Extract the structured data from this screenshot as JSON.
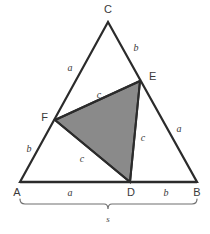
{
  "figure": {
    "background_color": "#ffffff",
    "stroke_color": "#2b2b2b",
    "shaded_fill_color": "#8a8a8a",
    "bracket_color": "#6e6e6e",
    "label_color": "#3a3a3a"
  },
  "vertices": [
    {
      "name": "C",
      "label": "C",
      "x": 108,
      "y": 22,
      "label_x": 108,
      "label_y": 11
    },
    {
      "name": "E",
      "label": "E",
      "x": 140,
      "y": 81,
      "label_x": 150,
      "label_y": 79
    },
    {
      "name": "F",
      "label": "F",
      "x": 55,
      "y": 120,
      "label_x": 44,
      "label_y": 119
    },
    {
      "name": "A",
      "label": "A",
      "x": 20,
      "y": 182,
      "label_x": 16,
      "label_y": 194
    },
    {
      "name": "D",
      "label": "D",
      "x": 130,
      "y": 182,
      "label_x": 130,
      "label_y": 194
    },
    {
      "name": "B",
      "label": "B",
      "x": 197,
      "y": 182,
      "label_x": 198,
      "label_y": 194
    }
  ],
  "outer_triangle": {
    "name": "triangle-ABC",
    "points": "20,182 108,22 197,182"
  },
  "shaded_triangle": {
    "name": "triangle-DEF",
    "points": "55,120 140,81 130,182",
    "fill": "#8a8a8a"
  },
  "segments": [
    {
      "name": "segment-AC",
      "x1": 20,
      "y1": 182,
      "x2": 108,
      "y2": 22
    },
    {
      "name": "segment-CB",
      "x1": 108,
      "y1": 22,
      "x2": 197,
      "y2": 182
    },
    {
      "name": "segment-AB",
      "x1": 20,
      "y1": 182,
      "x2": 197,
      "y2": 182
    },
    {
      "name": "segment-FE",
      "x1": 55,
      "y1": 120,
      "x2": 140,
      "y2": 81
    },
    {
      "name": "segment-ED",
      "x1": 140,
      "y1": 81,
      "x2": 130,
      "y2": 182
    },
    {
      "name": "segment-FD",
      "x1": 55,
      "y1": 120,
      "x2": 130,
      "y2": 182
    }
  ],
  "side_labels": [
    {
      "name": "label-AF",
      "text": "b",
      "x": 29,
      "y": 151,
      "segment": "A-F"
    },
    {
      "name": "label-FC",
      "text": "a",
      "x": 70,
      "y": 70,
      "segment": "F-C"
    },
    {
      "name": "label-CE",
      "text": "b",
      "x": 136,
      "y": 50,
      "segment": "C-E"
    },
    {
      "name": "label-EB",
      "text": "a",
      "x": 179,
      "y": 131,
      "segment": "E-B"
    },
    {
      "name": "label-AD",
      "text": "a",
      "x": 70,
      "y": 195,
      "segment": "A-D"
    },
    {
      "name": "label-DB",
      "text": "b",
      "x": 166,
      "y": 195,
      "segment": "D-B"
    },
    {
      "name": "label-FE",
      "text": "c",
      "x": 99,
      "y": 97,
      "segment": "F-E"
    },
    {
      "name": "label-ED",
      "text": "c",
      "x": 142,
      "y": 140,
      "segment": "E-D"
    },
    {
      "name": "label-FD",
      "text": "c",
      "x": 82,
      "y": 161,
      "segment": "F-D"
    }
  ],
  "span_bracket": {
    "name": "bracket-AB",
    "label": "s",
    "label_x": 108,
    "label_y": 219,
    "left_x": 20,
    "right_x": 197,
    "y": 204,
    "center_x": 108,
    "tick_depth": 5
  }
}
